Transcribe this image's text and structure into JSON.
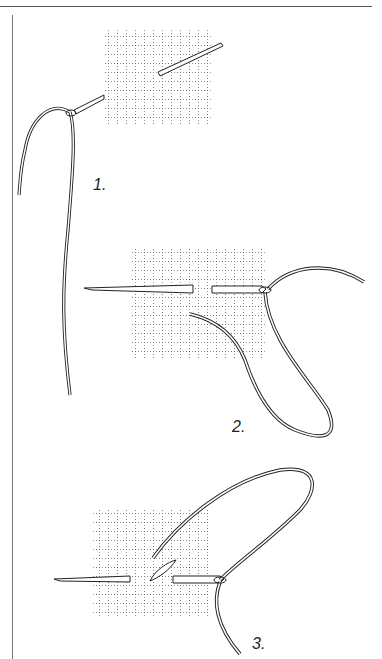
{
  "figure": {
    "type": "instructional illustration",
    "steps": [
      {
        "label": "1.",
        "description": "needle passes diagonally through canvas, thread through eye"
      },
      {
        "label": "2.",
        "description": "needle passes horizontally through canvas, thread looped"
      },
      {
        "label": "3.",
        "description": "needle passes horizontally, stitch formed on canvas"
      }
    ]
  },
  "colors": {
    "line": "#222222",
    "grid": "#888888",
    "background": "#ffffff"
  }
}
